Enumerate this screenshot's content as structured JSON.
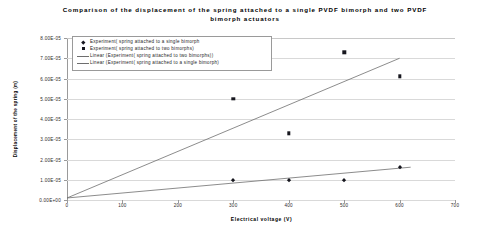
{
  "chart_data": {
    "type": "scatter",
    "title": "Comparison of the displacement of the spring attached to a single PVDF bimorph and two PVDF bimorph actuators",
    "xlabel": "Electrical voltage (V)",
    "ylabel": "Displacement of the spring (m)",
    "xlim": [
      0,
      700
    ],
    "ylim": [
      0,
      8e-05
    ],
    "grid": true,
    "legend_position": "top-left-inside",
    "xticks": [
      "0",
      "100",
      "200",
      "300",
      "400",
      "500",
      "600",
      "700"
    ],
    "xtick_values": [
      0,
      100,
      200,
      300,
      400,
      500,
      600,
      700
    ],
    "yticks": [
      "0.00E+00",
      "1.00E-05",
      "2.00E-05",
      "3.00E-05",
      "4.00E-05",
      "5.00E-05",
      "6.00E-05",
      "7.00E-05",
      "8.00E-05"
    ],
    "ytick_values": [
      0,
      1e-05,
      2e-05,
      3e-05,
      4e-05,
      5e-05,
      6e-05,
      7e-05,
      8e-05
    ],
    "series": [
      {
        "name": "Experiment( spring attached to a single bimorph",
        "marker": "diamond",
        "color": "#17171f",
        "x": [
          300,
          400,
          500,
          600
        ],
        "values": [
          1e-05,
          1e-05,
          1e-05,
          1.65e-05
        ]
      },
      {
        "name": "Experiment( spring attached to two bimorphs)",
        "marker": "square",
        "color": "#17171f",
        "x": [
          300,
          400,
          500,
          600
        ],
        "values": [
          5e-05,
          3.3e-05,
          7.3e-05,
          6.1e-05
        ]
      }
    ],
    "trendlines": [
      {
        "name": "Linear (Experiment( spring attached to two bimorphs))",
        "color": "#6e6e6e",
        "x": [
          0,
          600
        ],
        "values": [
          1e-06,
          7e-05
        ]
      },
      {
        "name": "Linear (Experiment( spring attached to a single bimorph)",
        "color": "#6e6e6e",
        "x": [
          0,
          620
        ],
        "values": [
          1e-06,
          1.62e-05
        ]
      }
    ]
  },
  "legend": {
    "entries": [
      {
        "key": "diamond",
        "label": "Experiment( spring attached to a single bimorph"
      },
      {
        "key": "square",
        "label": "Experiment( spring attached to two bimorphs)"
      },
      {
        "key": "line",
        "label": "Linear (Experiment( spring attached to two bimorphs))"
      },
      {
        "key": "line",
        "label": "Linear (Experiment( spring attached to a single bimorph)"
      }
    ]
  }
}
